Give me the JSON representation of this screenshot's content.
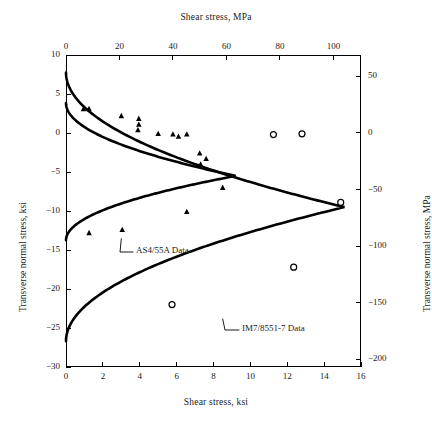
{
  "titles": {
    "top": "Shear stress, MPa",
    "bottom": "Shear stress, ksi",
    "left": "Transverse normal stress, ksi",
    "right": "Transverse normal stress, MPa"
  },
  "annotations": {
    "inner_label": "AS4/55A Data",
    "outer_label": "IM7/8551-7 Data"
  },
  "chart_data": {
    "type": "scatter",
    "title": "",
    "xlabel": "Shear stress, ksi",
    "ylabel": "Transverse normal stress, ksi",
    "xlabel_top": "Shear stress, MPa",
    "ylabel_right": "Transverse normal stress, MPa",
    "grid": false,
    "legend": "annotated-leader-lines",
    "xlim": [
      0,
      16
    ],
    "ylim": [
      -30,
      10
    ],
    "xlim_top": [
      0,
      110.3
    ],
    "ylim_right": [
      -206.8,
      68.9
    ],
    "xticks": [
      0,
      2,
      4,
      6,
      8,
      10,
      12,
      14,
      16
    ],
    "yticks": [
      10,
      5,
      0,
      -5,
      -10,
      -15,
      -20,
      -25,
      -30
    ],
    "xticks_top": [
      0,
      20,
      40,
      60,
      80,
      100
    ],
    "yticks_right": [
      50,
      0,
      -50,
      -100,
      -150,
      -200
    ],
    "xtick_labels": [
      "0",
      "2",
      "4",
      "6",
      "8",
      "10",
      "12",
      "14",
      "16"
    ],
    "ytick_labels": [
      "10",
      "5",
      "0",
      "−5",
      "−10",
      "−15",
      "−20",
      "−25",
      "−30"
    ],
    "xtick_labels_top": [
      "0",
      "20",
      "40",
      "60",
      "80",
      "100"
    ],
    "ytick_labels_right": [
      "50",
      "0",
      "−50",
      "−100",
      "−150",
      "−200"
    ],
    "series": [
      {
        "name": "AS4/55A Data",
        "marker": "triangle",
        "marker_filled": true,
        "points": [
          [
            0.95,
            3.1
          ],
          [
            1.25,
            3.1
          ],
          [
            3.0,
            2.2
          ],
          [
            3.95,
            1.85
          ],
          [
            3.95,
            1.1
          ],
          [
            3.9,
            0.4
          ],
          [
            5.0,
            -0.1
          ],
          [
            5.8,
            -0.15
          ],
          [
            6.1,
            -0.45
          ],
          [
            6.55,
            -0.15
          ],
          [
            7.25,
            -2.6
          ],
          [
            7.6,
            -3.3
          ],
          [
            7.3,
            -4.0
          ],
          [
            8.5,
            -7.0
          ],
          [
            6.55,
            -10.1
          ],
          [
            3.05,
            -12.4
          ],
          [
            1.25,
            -12.8
          ]
        ]
      },
      {
        "name": "IM7/8551-7 Data",
        "marker": "circle",
        "marker_filled": false,
        "points": [
          [
            11.25,
            -0.2
          ],
          [
            12.8,
            -0.1
          ],
          [
            14.9,
            -8.9
          ],
          [
            12.35,
            -17.2
          ],
          [
            5.75,
            -22.0
          ]
        ]
      }
    ],
    "curves": [
      {
        "name": "AS4/55A envelope",
        "style": "solid-thick",
        "vertex": [
          9.2,
          -5.5
        ],
        "y_top_at_x0": 3.85,
        "y_bottom_at_x0": -13.75
      },
      {
        "name": "IM7/8551-7 envelope",
        "style": "solid-thick",
        "vertex": [
          15.1,
          -9.5
        ],
        "y_top_at_x0": 7.75,
        "y_bottom_at_x0": -26.7
      }
    ]
  }
}
